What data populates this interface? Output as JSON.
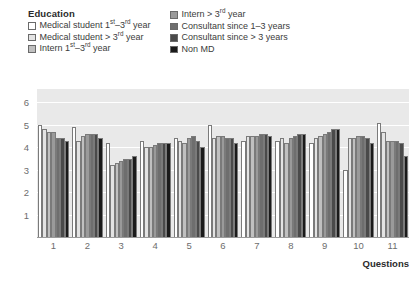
{
  "legend": {
    "title": "Education",
    "left_items": [
      {
        "label": "Medical student 1st–3rd year",
        "label_html": "Medical student 1<sup>st</sup>–3<sup>rd</sup> year",
        "color": "#ffffff",
        "key": "medical-student-1-3"
      },
      {
        "label": "Medical student > 3rd year",
        "label_html": "Medical student > 3<sup>rd</sup> year",
        "color": "#e3e3e3",
        "key": "medical-student-gt3"
      },
      {
        "label": "Intern 1st–3rd year",
        "label_html": "Intern 1<sup>st</sup>–3<sup>rd</sup> year",
        "color": "#c0c0c0",
        "key": "intern-1-3"
      }
    ],
    "right_items": [
      {
        "label": "Intern > 3rd year",
        "label_html": "Intern > 3<sup>rd</sup> year",
        "color": "#9a9a9a",
        "key": "intern-gt3"
      },
      {
        "label": "Consultant since 1–3 years",
        "label_html": "Consultant since 1–3 years",
        "color": "#6e6e6e",
        "key": "consultant-1-3"
      },
      {
        "label": "Consultant since > 3 years",
        "label_html": "Consultant since > 3 years",
        "color": "#4a4a4a",
        "key": "consultant-gt3"
      },
      {
        "label": "Non MD",
        "label_html": "Non MD",
        "color": "#1a1a1a",
        "key": "non-md"
      }
    ]
  },
  "axes": {
    "y_ticks": [
      "6",
      "5",
      "4",
      "3",
      "2",
      "1"
    ],
    "x_title": "Questions"
  },
  "chart_data": {
    "type": "bar",
    "title": "",
    "subtitle": "",
    "xlabel": "Questions",
    "ylabel": "",
    "ylim": [
      0,
      6.6
    ],
    "yticks": [
      1,
      2,
      3,
      4,
      5,
      6
    ],
    "grid": true,
    "legend_position": "top",
    "legend_title": "Education",
    "categories": [
      "1",
      "2",
      "3",
      "4",
      "5",
      "6",
      "7",
      "8",
      "9",
      "10",
      "11"
    ],
    "series": [
      {
        "name": "Medical student 1st–3rd year",
        "color": "#ffffff",
        "values": [
          5.0,
          4.9,
          4.2,
          4.3,
          4.4,
          5.0,
          4.3,
          4.3,
          4.2,
          3.0,
          5.1
        ]
      },
      {
        "name": "Medical student > 3rd year",
        "color": "#e3e3e3",
        "values": [
          4.8,
          4.3,
          3.2,
          4.0,
          4.3,
          4.4,
          4.5,
          4.4,
          4.4,
          4.4,
          4.7
        ]
      },
      {
        "name": "Intern 1st–3rd year",
        "color": "#c0c0c0",
        "values": [
          4.7,
          4.5,
          3.3,
          4.0,
          4.2,
          4.5,
          4.5,
          4.2,
          4.5,
          4.4,
          4.3
        ]
      },
      {
        "name": "Intern > 3rd year",
        "color": "#9a9a9a",
        "values": [
          4.7,
          4.6,
          3.4,
          4.1,
          4.4,
          4.5,
          4.5,
          4.4,
          4.6,
          4.5,
          4.3
        ]
      },
      {
        "name": "Consultant since 1–3 years",
        "color": "#6e6e6e",
        "values": [
          4.4,
          4.6,
          3.5,
          4.2,
          4.5,
          4.4,
          4.6,
          4.5,
          4.7,
          4.5,
          4.3
        ]
      },
      {
        "name": "Consultant since > 3 years",
        "color": "#4a4a4a",
        "values": [
          4.4,
          4.6,
          3.5,
          4.2,
          4.3,
          4.4,
          4.6,
          4.6,
          4.8,
          4.4,
          4.2
        ]
      },
      {
        "name": "Non MD",
        "color": "#1a1a1a",
        "values": [
          4.3,
          4.4,
          3.6,
          4.2,
          4.0,
          4.2,
          4.5,
          4.6,
          4.8,
          4.2,
          3.6
        ]
      }
    ]
  }
}
